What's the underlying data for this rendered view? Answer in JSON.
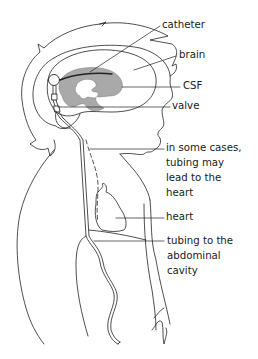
{
  "diagram": {
    "colors": {
      "line": "#222222",
      "csf_fill": "#a9a9a9",
      "background": "#ffffff"
    },
    "labels": [
      {
        "id": "catheter",
        "text": "catheter"
      },
      {
        "id": "brain",
        "text": "brain"
      },
      {
        "id": "csf",
        "text": "CSF"
      },
      {
        "id": "valve",
        "text": "valve"
      },
      {
        "id": "some_cases_1",
        "text": "in some cases,"
      },
      {
        "id": "some_cases_2",
        "text": "tubing may"
      },
      {
        "id": "some_cases_3",
        "text": "lead to the"
      },
      {
        "id": "some_cases_4",
        "text": "heart"
      },
      {
        "id": "heart",
        "text": "heart"
      },
      {
        "id": "tubing_1",
        "text": "tubing to the"
      },
      {
        "id": "tubing_2",
        "text": "abdominal"
      },
      {
        "id": "tubing_3",
        "text": "cavity"
      }
    ]
  }
}
